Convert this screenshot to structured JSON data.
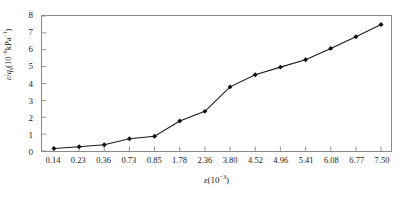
{
  "chart_data": {
    "type": "line",
    "title": "",
    "xlabel": "ε(10⁻³)",
    "ylabel": "ε/qₛ(10⁻⁶kPa⁻¹)",
    "categories": [
      "0.14",
      "0.23",
      "0.36",
      "0.73",
      "0.85",
      "1.78",
      "2.36",
      "3.80",
      "4.52",
      "4.96",
      "5.41",
      "6.08",
      "6.77",
      "7.50"
    ],
    "values": [
      0.15,
      0.25,
      0.37,
      0.73,
      0.87,
      1.78,
      2.35,
      3.8,
      4.52,
      4.97,
      5.41,
      6.08,
      6.77,
      7.5
    ],
    "series": [
      {
        "name": "ε/qₛ",
        "values": [
          0.15,
          0.25,
          0.37,
          0.73,
          0.87,
          1.78,
          2.35,
          3.8,
          4.52,
          4.97,
          5.41,
          6.08,
          6.77,
          7.5
        ]
      }
    ],
    "ylim": [
      0,
      8
    ],
    "yticks": [
      0,
      1,
      2,
      3,
      4,
      5,
      6,
      7,
      8
    ],
    "ytick_labels": [
      "0",
      "1",
      "2",
      "3",
      "4",
      "5",
      "6",
      "7",
      "8"
    ],
    "grid": false,
    "legend": "none",
    "marker": "filled-diamond",
    "line_color": "#1a1a1a",
    "marker_color": "#111111",
    "frame_color": "#8a8a8a",
    "background": "#ffffff",
    "x_axis_kind": "categorical"
  },
  "axes": {
    "y_title_parts": {
      "epsilon": "ε",
      "slash": "/",
      "q": "q",
      "q_sub": "s",
      "open": "(10",
      "exp1": "−6",
      "unit": "kPa",
      "exp2": "−1",
      "close": ")"
    },
    "x_title_parts": {
      "epsilon": "ε",
      "open": "(10",
      "exp": "−3",
      "close": ")"
    }
  }
}
